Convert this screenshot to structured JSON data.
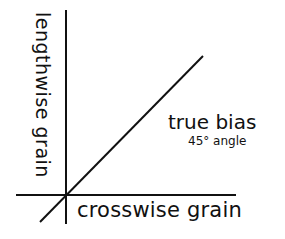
{
  "diagram": {
    "type": "fabric-grain-diagram",
    "labels": {
      "vertical_axis": "lengthwise grain",
      "horizontal_axis": "crosswise grain",
      "diagonal_title": "true bias",
      "diagonal_subtitle": "45° angle"
    },
    "colors": {
      "background": "#ffffff",
      "ink": "#111111"
    },
    "lines": {
      "vertical": {
        "x": 66,
        "y1": 10,
        "y2": 224
      },
      "horizontal": {
        "y": 195,
        "x1": 16,
        "x2": 236
      },
      "diagonal": {
        "x1": 40,
        "y1": 222,
        "x2": 203,
        "y2": 56,
        "angle_degrees": 45
      }
    }
  }
}
